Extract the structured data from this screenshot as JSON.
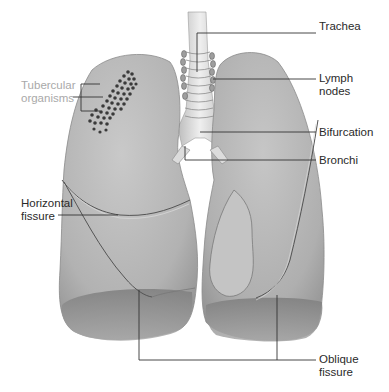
{
  "diagram": {
    "colors": {
      "background": "#ffffff",
      "lung_fill": "#b7b7b7",
      "lung_shadow": "#8f8f8f",
      "lung_highlight": "#d6d6d6",
      "trachea_fill": "#e4e4e4",
      "leader_line": "#333333",
      "label_text": "#2a2a2a",
      "tubercular_label_text": "#a9a9a9",
      "organism_dots": "#3a3a3a"
    },
    "labels": {
      "trachea": {
        "line1": "Trachea"
      },
      "lymph_nodes": {
        "line1": "Lymph",
        "line2": "nodes"
      },
      "bifurcation": {
        "line1": "Bifurcation"
      },
      "bronchi": {
        "line1": "Bronchi"
      },
      "tubercular_organisms": {
        "line1": "Tubercular",
        "line2": "organisms"
      },
      "horizontal_fissure": {
        "line1": "Horizontal",
        "line2": "fissure"
      },
      "oblique_fissure": {
        "line1": "Oblique",
        "line2": "fissure"
      }
    }
  }
}
